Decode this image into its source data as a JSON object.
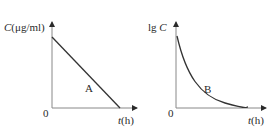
{
  "chart_data": [
    {
      "type": "line",
      "title": "",
      "ylabel": "C(μg/ml)",
      "xlabel": "t(h)",
      "origin_label": "0",
      "series": [
        {
          "name": "A",
          "shape": "linear decrease",
          "x": [
            0,
            1
          ],
          "values": [
            1,
            0
          ]
        }
      ],
      "grid": false,
      "legend": "none"
    },
    {
      "type": "line",
      "title": "",
      "ylabel": "lg C",
      "xlabel": "t(h)",
      "origin_label": "0",
      "series": [
        {
          "name": "B",
          "shape": "exponential decay curve",
          "x": [
            0,
            0.25,
            0.5,
            0.75,
            1
          ],
          "values": [
            1,
            0.45,
            0.2,
            0.08,
            0.02
          ]
        }
      ],
      "grid": false,
      "legend": "none"
    }
  ],
  "left": {
    "ylabel_prefix": "C",
    "ylabel_unit": "(μg/ml)",
    "xlabel_var": "t",
    "xlabel_unit": "(h)",
    "origin": "0",
    "curve_label": "A"
  },
  "right": {
    "ylabel": "lg C",
    "xlabel_var": "t",
    "xlabel_unit": "(h)",
    "origin": "0",
    "curve_label": "B"
  }
}
